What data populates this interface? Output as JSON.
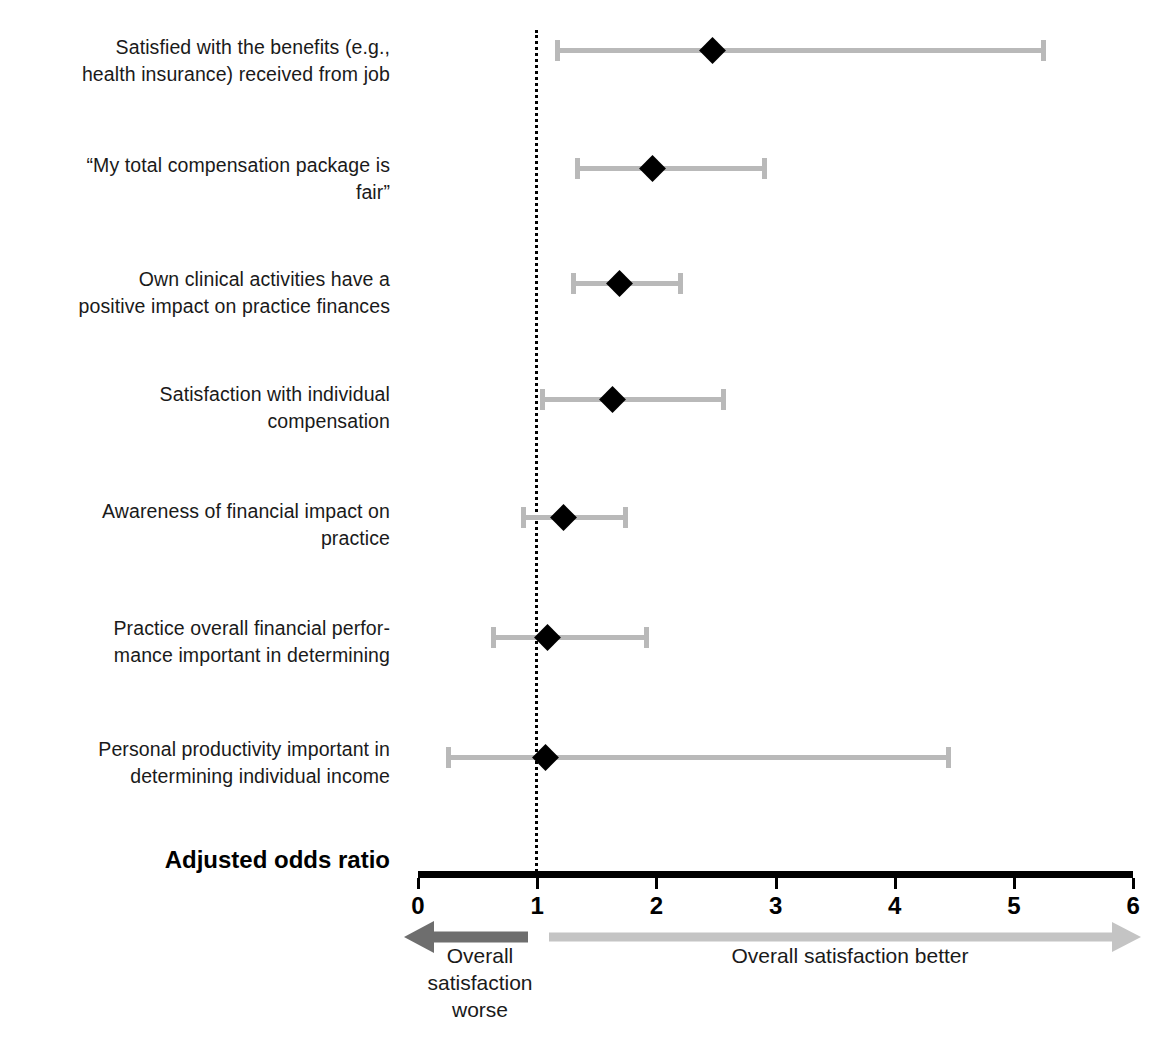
{
  "chart_data": {
    "type": "forest",
    "title": "",
    "xlabel": "Adjusted odds ratio",
    "ylabel": "",
    "xlim": [
      0,
      6
    ],
    "xticks": [
      0,
      1,
      2,
      3,
      4,
      5,
      6
    ],
    "xtick_labels": [
      "0",
      "1",
      "2",
      "3",
      "4",
      "5",
      "6"
    ],
    "reference_value": 1,
    "grid": false,
    "legend_position": "below-axis",
    "annotations": {
      "left_arrow_label": "Overall satisfaction worse",
      "right_arrow_label": "Overall satisfaction better"
    },
    "categories": [
      "Satisfied with the benefits (e.g., health insurance) received from job",
      "“My total compensation package is fair”",
      "Own clinical activities have a positive impact on practice finances",
      "Satisfaction with individual compensation",
      "Awareness of financial impact on practice",
      "Practice overall financial perfor-mance important in determining",
      "Personal productivity important in determining individual income"
    ],
    "values": [
      2.47,
      1.97,
      1.69,
      1.63,
      1.22,
      1.09,
      1.07
    ],
    "ci_low": [
      1.17,
      1.33,
      1.3,
      1.04,
      0.88,
      0.63,
      0.25
    ],
    "ci_high": [
      5.24,
      2.9,
      2.2,
      2.56,
      1.74,
      1.91,
      4.45
    ]
  },
  "rows": [
    {
      "label_line1": "Satisfied with the benefits (e.g.,",
      "label_line2": "health insurance) received from job",
      "or": 2.47,
      "low": 1.17,
      "high": 5.24
    },
    {
      "label_line1": "“My total compensation package is",
      "label_line2": "fair”",
      "or": 1.97,
      "low": 1.33,
      "high": 2.9
    },
    {
      "label_line1": "Own clinical activities have a",
      "label_line2": "positive impact on practice finances",
      "or": 1.69,
      "low": 1.3,
      "high": 2.2
    },
    {
      "label_line1": "Satisfaction with individual",
      "label_line2": "compensation",
      "or": 1.63,
      "low": 1.04,
      "high": 2.56
    },
    {
      "label_line1": "Awareness of financial impact on",
      "label_line2": "practice",
      "or": 1.22,
      "low": 0.88,
      "high": 1.74
    },
    {
      "label_line1": "Practice overall financial perfor-",
      "label_line2": "mance important in determining",
      "or": 1.09,
      "low": 0.63,
      "high": 1.91
    },
    {
      "label_line1": "Personal productivity important in",
      "label_line2": "determining individual income",
      "or": 1.07,
      "low": 0.25,
      "high": 4.45
    }
  ],
  "axis": {
    "title": "Adjusted odds ratio",
    "ticks": [
      "0",
      "1",
      "2",
      "3",
      "4",
      "5",
      "6"
    ]
  },
  "legend": {
    "worse": "Overall satisfaction worse",
    "better": "Overall satisfaction better"
  },
  "colors": {
    "ci_bar": "#b9b9b9",
    "point": "#000000",
    "axis": "#000000",
    "arrow_left": "#6e6e6e",
    "arrow_right": "#c0c0c0",
    "text": "#1a1a1a"
  }
}
